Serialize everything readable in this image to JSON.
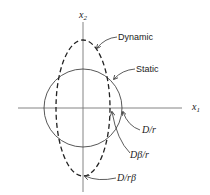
{
  "axes": {
    "x_label": "x",
    "x_sub": "1",
    "y_label": "x",
    "y_sub": "2"
  },
  "curves": {
    "dynamic_label": "Dynamic",
    "static_label": "Static"
  },
  "annotations": {
    "d_over_r": "D/r",
    "d_beta_over_r": "Dβ/r",
    "d_over_r_beta": "D/rβ"
  }
}
